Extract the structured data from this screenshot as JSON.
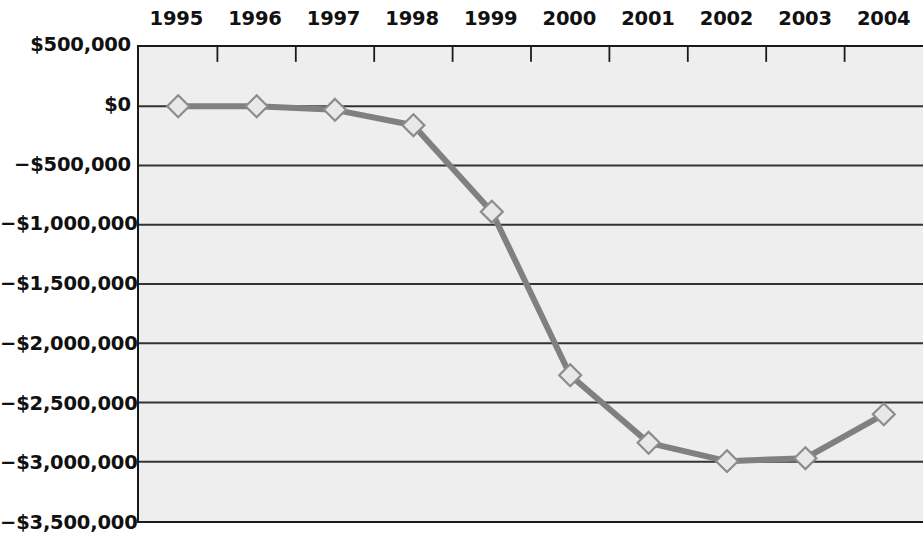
{
  "chart_data": {
    "type": "line",
    "title": "",
    "subtitle": "",
    "xlabel": "",
    "ylabel": "",
    "categories": [
      "1995",
      "1996",
      "1997",
      "1998",
      "1999",
      "2000",
      "2001",
      "2002",
      "2003",
      "2004"
    ],
    "series": [
      {
        "name": "Cumulative Cash Flow",
        "values": [
          0,
          0,
          -30000,
          -160000,
          -890000,
          -2270000,
          -2840000,
          -2995000,
          -2970000,
          -2600000
        ]
      }
    ],
    "y_tick_labels": [
      "$500,000",
      "$0",
      "−$500,000",
      "−$1,000,000",
      "−$1,500,000",
      "−$2,000,000",
      "−$2,500,000",
      "−$3,000,000",
      "−$3,500,000"
    ],
    "y_tick_values": [
      500000,
      0,
      -500000,
      -1000000,
      -1500000,
      -2000000,
      -2500000,
      -3000000,
      -3500000
    ],
    "ylim": [
      -3500000,
      500000
    ],
    "grid": true,
    "grid_axis": "y",
    "legend": "none",
    "x_axis_position": "top",
    "marker": "diamond",
    "colors": {
      "line": "#808080",
      "marker_fill": "#e8e8e8",
      "marker_edge": "#8c8c8c",
      "plot_background": "#eeeeee",
      "axis": "#1a1a1a",
      "gridline": "#333333",
      "text": "#111111"
    }
  }
}
